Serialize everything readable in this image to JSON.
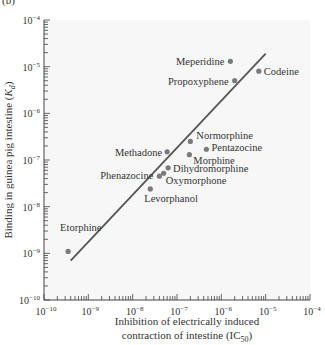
{
  "panel_label": "(b)",
  "chart_data": {
    "type": "scatter",
    "title": "",
    "xlabel": "Inhibition of electrically induced contraction of intestine (IC50)",
    "xlabel_lines": [
      "Inhibition of electrically induced",
      "contraction of intestine (IC",
      "50",
      ")"
    ],
    "ylabel": "Binding in guinea pig intestine (Kd)",
    "ylabel_parts": [
      "Binding in guinea pig intestine (",
      "K",
      "d",
      ")"
    ],
    "xscale": "log",
    "yscale": "log",
    "xlim": [
      1e-10,
      0.0001
    ],
    "ylim": [
      1e-10,
      0.0001
    ],
    "x_ticks": [
      "10-10",
      "10-9",
      "10-8",
      "10-7",
      "10-6",
      "10-5",
      "10-4"
    ],
    "y_ticks": [
      "10-4",
      "10-5",
      "10-6",
      "10-7",
      "10-8",
      "10-9",
      "10-10"
    ],
    "tick_exponents": [
      "-10",
      "-9",
      "-8",
      "-7",
      "-6",
      "-5",
      "-4"
    ],
    "grid": false,
    "legend": null,
    "points": [
      {
        "name": "Meperidine",
        "x": 1.6e-06,
        "y": 1.3e-05
      },
      {
        "name": "Codeine",
        "x": 7e-06,
        "y": 8e-06
      },
      {
        "name": "Propoxyphene",
        "x": 2e-06,
        "y": 5e-06
      },
      {
        "name": "Normorphine",
        "x": 2e-07,
        "y": 2.5e-07
      },
      {
        "name": "Pentazocine",
        "x": 4.6e-07,
        "y": 1.7e-07
      },
      {
        "name": "Methadone",
        "x": 6e-08,
        "y": 1.5e-07
      },
      {
        "name": "Morphine",
        "x": 1.9e-07,
        "y": 1.3e-07
      },
      {
        "name": "Dihydromorphine",
        "x": 6.3e-08,
        "y": 6.8e-08
      },
      {
        "name": "Phenazocine",
        "x": 4e-08,
        "y": 4.5e-08
      },
      {
        "name": "Oxymorphone",
        "x": 5e-08,
        "y": 5.2e-08
      },
      {
        "name": "Levorphanol",
        "x": 2.5e-08,
        "y": 2.4e-08
      },
      {
        "name": "Etorphine",
        "x": 3.5e-10,
        "y": 1.1e-09
      }
    ],
    "fit_line": {
      "from": {
        "x": 4e-10,
        "y": 7e-10
      },
      "to": {
        "x": 1e-05,
        "y": 1.9e-05
      }
    },
    "colors": {
      "point": "#7a7a7a",
      "line": "#555555",
      "plot_bg": "#f7f7f7"
    }
  }
}
